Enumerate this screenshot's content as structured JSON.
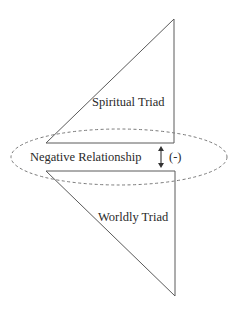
{
  "diagram": {
    "upper_triangle": {
      "label": "Spiritual Triad",
      "stroke": "#555555"
    },
    "lower_triangle": {
      "label": "Worldly Triad",
      "stroke": "#555555"
    },
    "relationship": {
      "label": "Negative Relationship",
      "sign": "(-)",
      "arrow_icon": "double-vertical-arrow",
      "ellipse_stroke": "#777777",
      "ellipse_style": "dashed"
    }
  }
}
